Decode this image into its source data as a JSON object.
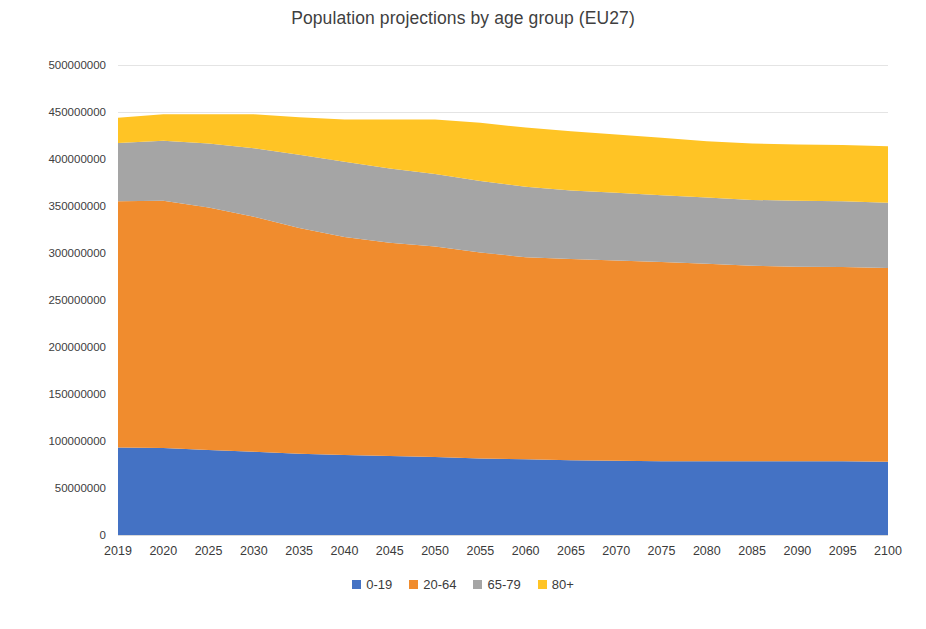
{
  "chart_data": {
    "type": "area",
    "stacked": true,
    "title": "Population projections by age group (EU27)",
    "xlabel": "",
    "ylabel": "",
    "grid": true,
    "legend_position": "bottom",
    "ylim": [
      0,
      500000000
    ],
    "ytick_labels": [
      "500000000",
      "450000000",
      "400000000",
      "350000000",
      "300000000",
      "250000000",
      "200000000",
      "150000000",
      "100000000",
      "50000000",
      "0"
    ],
    "ytick_values": [
      500000000,
      450000000,
      400000000,
      350000000,
      300000000,
      250000000,
      200000000,
      150000000,
      100000000,
      50000000,
      0
    ],
    "categories": [
      "2019",
      "2020",
      "2025",
      "2030",
      "2035",
      "2040",
      "2045",
      "2050",
      "2055",
      "2060",
      "2065",
      "2070",
      "2075",
      "2080",
      "2085",
      "2090",
      "2095",
      "2100"
    ],
    "series": [
      {
        "name": "0-19",
        "color": "#4472C4",
        "values": [
          93000000,
          92500000,
          90500000,
          88500000,
          86500000,
          85000000,
          84000000,
          83000000,
          81500000,
          80500000,
          79500000,
          79000000,
          78500000,
          78500000,
          78500000,
          78500000,
          78500000,
          78000000
        ]
      },
      {
        "name": "20-64",
        "color": "#F08C2E",
        "values": [
          262000000,
          263000000,
          258000000,
          250000000,
          240000000,
          232000000,
          227000000,
          224000000,
          219000000,
          215000000,
          214000000,
          213000000,
          212000000,
          210000000,
          208000000,
          207000000,
          206500000,
          206000000
        ]
      },
      {
        "name": "65-79",
        "color": "#A5A5A5",
        "values": [
          62000000,
          64000000,
          68000000,
          73000000,
          78000000,
          80000000,
          79000000,
          77000000,
          76000000,
          75000000,
          73000000,
          72000000,
          71000000,
          70500000,
          70000000,
          70000000,
          70000000,
          69500000
        ]
      },
      {
        "name": "80+",
        "color": "#FFC425",
        "values": [
          27000000,
          28000000,
          31000000,
          36000000,
          40000000,
          45000000,
          52000000,
          58000000,
          62000000,
          63000000,
          63000000,
          62000000,
          61000000,
          60000000,
          60000000,
          60000000,
          60000000,
          60000000
        ]
      }
    ]
  },
  "legend": {
    "items": [
      {
        "label": "0-19",
        "color": "#4472C4"
      },
      {
        "label": "20-64",
        "color": "#F08C2E"
      },
      {
        "label": "65-79",
        "color": "#A5A5A5"
      },
      {
        "label": "80+",
        "color": "#FFC425"
      }
    ]
  }
}
